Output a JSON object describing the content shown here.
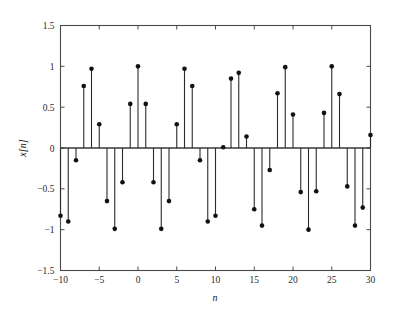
{
  "chart_data": {
    "type": "scatter",
    "plot_style": "stem",
    "title": "",
    "subtitle": "",
    "xlabel": "n",
    "ylabel": "x[n]",
    "xlim": [
      -10,
      30
    ],
    "ylim": [
      -1.5,
      1.5
    ],
    "grid": false,
    "legend": null,
    "legend_position": "none",
    "xticks": [
      -10,
      -5,
      0,
      5,
      10,
      15,
      20,
      25,
      30
    ],
    "xtick_labels": [
      "−10",
      "−5",
      "0",
      "5",
      "10",
      "15",
      "20",
      "25",
      "30"
    ],
    "yticks": [
      -1.5,
      -1,
      -0.5,
      0,
      0.5,
      1,
      1.5
    ],
    "ytick_labels": [
      "−1.5",
      "−1",
      "−0.5",
      "0",
      "0.5",
      "1",
      "1.5"
    ],
    "marker": "filled-circle",
    "stem_color": "#2b2b2b",
    "marker_color": "#111111",
    "baseline": 0,
    "x": [
      -10,
      -9,
      -8,
      -7,
      -6,
      -5,
      -4,
      -3,
      -2,
      -1,
      0,
      1,
      2,
      3,
      4,
      5,
      6,
      7,
      8,
      9,
      10,
      11,
      12,
      13,
      14,
      15,
      16,
      17,
      18,
      19,
      20,
      21,
      22,
      23,
      24,
      25,
      26,
      27,
      28,
      29,
      30
    ],
    "values": [
      -0.83,
      -0.9,
      -0.15,
      0.76,
      0.97,
      0.29,
      -0.65,
      -0.99,
      -0.42,
      0.54,
      1.0,
      0.54,
      -0.42,
      -0.99,
      -0.65,
      0.29,
      0.97,
      0.76,
      -0.15,
      -0.9,
      -0.83,
      0.01,
      0.85,
      0.92,
      0.14,
      -0.75,
      -0.95,
      -0.27,
      0.67,
      0.99,
      0.41,
      -0.54,
      -1.0,
      -0.53,
      0.43,
      1.0,
      0.66,
      -0.47,
      -0.95,
      -0.73,
      0.16
    ]
  },
  "axes": {
    "x_title": "n",
    "y_title": "x[n]"
  }
}
